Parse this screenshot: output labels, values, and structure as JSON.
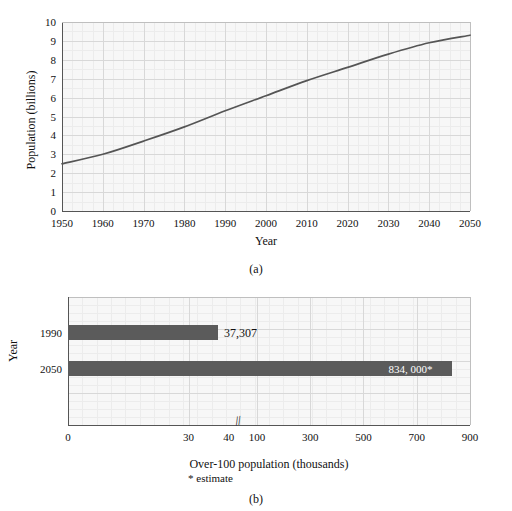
{
  "figure": {
    "panel_a_caption": "(a)",
    "panel_b_caption": "(b)"
  },
  "chart_data": [
    {
      "id": "world-population-line",
      "type": "line",
      "title": "",
      "xlabel": "Year",
      "ylabel": "Population (billions)",
      "xlim": [
        1950,
        2050
      ],
      "ylim": [
        0,
        10
      ],
      "grid": true,
      "legend": "none",
      "xticks": [
        1950,
        1960,
        1970,
        1980,
        1990,
        2000,
        2010,
        2020,
        2030,
        2040,
        2050
      ],
      "xtick_labels": [
        "1950",
        "1960",
        "1970",
        "1980",
        "1990",
        "2000",
        "2010",
        "2020",
        "2030",
        "2040",
        "2050"
      ],
      "yticks": [
        0,
        1,
        2,
        3,
        4,
        5,
        6,
        7,
        8,
        9,
        10
      ],
      "ytick_labels": [
        "0",
        "1",
        "2",
        "3",
        "4",
        "5",
        "6",
        "7",
        "8",
        "9",
        "10"
      ],
      "series": [
        {
          "name": "World population",
          "color": "#555555",
          "x": [
            1950,
            1960,
            1970,
            1980,
            1990,
            2000,
            2010,
            2020,
            2030,
            2040,
            2050
          ],
          "values": [
            2.5,
            3.0,
            3.7,
            4.45,
            5.3,
            6.1,
            6.9,
            7.6,
            8.3,
            8.9,
            9.3
          ]
        }
      ]
    },
    {
      "id": "over-100-population-bar",
      "type": "bar",
      "orientation": "horizontal",
      "title": "",
      "xlabel": "Over-100 population (thousands)",
      "ylabel": "Year",
      "footnote": "* estimate",
      "grid": true,
      "legend": "none",
      "axis_break": {
        "present": true,
        "glyph": "//",
        "between": [
          40,
          100
        ]
      },
      "xtick_labels": [
        "0",
        "30",
        "40",
        "100",
        "300",
        "500",
        "700",
        "900"
      ],
      "xtick_values": [
        0,
        30,
        40,
        100,
        300,
        500,
        700,
        900
      ],
      "categories": [
        "1990",
        "2050"
      ],
      "values": [
        37.307,
        834.0
      ],
      "bar_color": "#5b5b5b",
      "bars": [
        {
          "category": "1990",
          "value": 37.307,
          "display_label": "37,307",
          "label_position": "outside"
        },
        {
          "category": "2050",
          "value": 834.0,
          "display_label": "834, 000*",
          "label_position": "inside"
        }
      ]
    }
  ]
}
